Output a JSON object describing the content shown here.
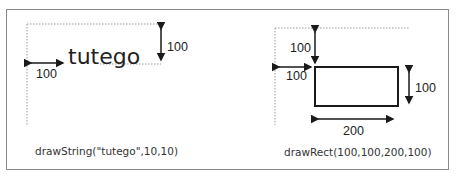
{
  "figure": {
    "left_panel": {
      "text_sample": "tutego",
      "dim_vertical_label": "100",
      "dim_horizontal_label": "100",
      "caption": "drawString(\"tutego\",10,10)"
    },
    "right_panel": {
      "dim_top_offset_label": "100",
      "dim_left_offset_label": "100",
      "dim_height_label": "100",
      "dim_width_label": "200",
      "caption": "drawRect(100,100,200,100)"
    },
    "colors": {
      "line": "#1a1a1a",
      "dotted_guide": "#9a9a9a",
      "frame": "#8a8a8a"
    }
  }
}
